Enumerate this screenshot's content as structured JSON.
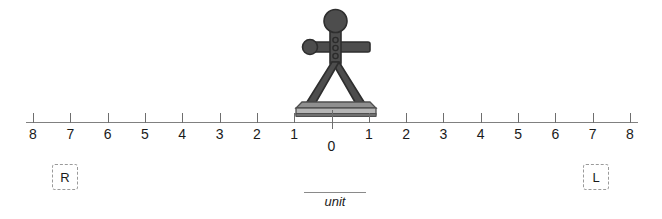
{
  "diagram": {
    "title_visible": false,
    "background_color": "#ffffff",
    "figure": {
      "icon": "person-standing-on-board-icon",
      "description": "stick figure standing on a board with arms outstretched",
      "body_color": "#4d4d4d",
      "outline_color": "#2e2e2e",
      "board_color": "#a8a8a8",
      "board_edge_color": "#5c5c5c",
      "position_value": "0"
    },
    "number_line": {
      "axis_color": "#808080",
      "tick_color": "#6e6e6e",
      "label_color": "#1a1a1a",
      "zero_label": "0",
      "left_labels": [
        "8",
        "7",
        "6",
        "5",
        "4",
        "3",
        "2",
        "1"
      ],
      "right_labels": [
        "1",
        "2",
        "3",
        "4",
        "5",
        "6",
        "7",
        "8"
      ],
      "all_labels": [
        "8",
        "7",
        "6",
        "5",
        "4",
        "3",
        "2",
        "1",
        "0",
        "1",
        "2",
        "3",
        "4",
        "5",
        "6",
        "7",
        "8"
      ],
      "tick_count": 17
    },
    "drop_targets": [
      {
        "id": "left",
        "label": "R",
        "border_style": "dashed",
        "border_color": "#9a9a9a"
      },
      {
        "id": "right",
        "label": "L",
        "border_style": "dashed",
        "border_color": "#9a9a9a"
      }
    ],
    "unit_caption": {
      "text": "unit",
      "style": "italic",
      "rule_color": "#8a8a8a"
    }
  }
}
